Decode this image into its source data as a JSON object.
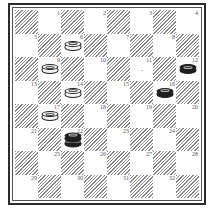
{
  "board": {
    "size": 8,
    "top_left_square": "dark",
    "numbered_squares": "light",
    "colors": {
      "dark_hatch": "#8a8a8a",
      "light": "#ffffff",
      "frame": "#2b2b2b"
    },
    "rows": [
      [
        {
          "c": "dark"
        },
        {
          "c": "light",
          "n": "1"
        },
        {
          "c": "dark"
        },
        {
          "c": "light",
          "n": "2"
        },
        {
          "c": "dark"
        },
        {
          "c": "light",
          "n": "3"
        },
        {
          "c": "dark"
        },
        {
          "c": "light",
          "n": "4"
        }
      ],
      [
        {
          "c": "light",
          "n": "5"
        },
        {
          "c": "dark"
        },
        {
          "c": "light",
          "n": "6",
          "piece": "white"
        },
        {
          "c": "dark"
        },
        {
          "c": "light",
          "n": "7"
        },
        {
          "c": "dark"
        },
        {
          "c": "light",
          "n": "8"
        },
        {
          "c": "dark"
        }
      ],
      [
        {
          "c": "dark"
        },
        {
          "c": "light",
          "n": "9",
          "piece": "white"
        },
        {
          "c": "dark"
        },
        {
          "c": "light",
          "n": "10"
        },
        {
          "c": "dark"
        },
        {
          "c": "light",
          "n": "11",
          "mark": "-"
        },
        {
          "c": "dark"
        },
        {
          "c": "light",
          "n": "12",
          "piece": "black"
        }
      ],
      [
        {
          "c": "light",
          "n": "13"
        },
        {
          "c": "dark"
        },
        {
          "c": "light",
          "n": "14",
          "piece": "white"
        },
        {
          "c": "dark"
        },
        {
          "c": "light",
          "n": "15"
        },
        {
          "c": "dark"
        },
        {
          "c": "light",
          "n": "16",
          "piece": "black"
        },
        {
          "c": "dark"
        }
      ],
      [
        {
          "c": "dark"
        },
        {
          "c": "light",
          "n": "17",
          "piece": "white"
        },
        {
          "c": "dark"
        },
        {
          "c": "light",
          "n": "18"
        },
        {
          "c": "dark"
        },
        {
          "c": "light",
          "n": "19"
        },
        {
          "c": "dark"
        },
        {
          "c": "light",
          "n": "20"
        }
      ],
      [
        {
          "c": "light",
          "n": "21"
        },
        {
          "c": "dark"
        },
        {
          "c": "light",
          "n": "22",
          "piece": "black-king"
        },
        {
          "c": "dark"
        },
        {
          "c": "light",
          "n": "23"
        },
        {
          "c": "dark"
        },
        {
          "c": "light",
          "n": "24"
        },
        {
          "c": "dark"
        }
      ],
      [
        {
          "c": "dark"
        },
        {
          "c": "light",
          "n": "25"
        },
        {
          "c": "dark"
        },
        {
          "c": "light",
          "n": "26"
        },
        {
          "c": "dark"
        },
        {
          "c": "light",
          "n": "27"
        },
        {
          "c": "dark"
        },
        {
          "c": "light",
          "n": "28"
        }
      ],
      [
        {
          "c": "light",
          "n": "29"
        },
        {
          "c": "dark"
        },
        {
          "c": "light",
          "n": "30"
        },
        {
          "c": "dark"
        },
        {
          "c": "light",
          "n": "31"
        },
        {
          "c": "dark"
        },
        {
          "c": "light",
          "n": "32"
        },
        {
          "c": "dark"
        }
      ]
    ]
  },
  "pieces": {
    "white_men": [
      "6",
      "9",
      "14",
      "17"
    ],
    "black_men": [
      "12",
      "16"
    ],
    "black_kings": [
      "22"
    ]
  },
  "marks": [
    {
      "square": "11",
      "text": "-"
    }
  ]
}
